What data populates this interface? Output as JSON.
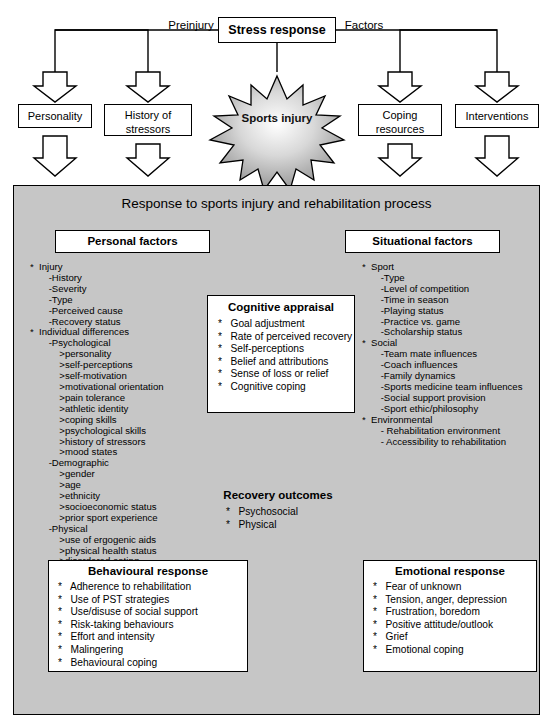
{
  "top": {
    "stress_response": "Stress response",
    "preinjury": "Preinjury",
    "factors": "Factors",
    "personality": "Personality",
    "history_of_stressors": "History of\nstressors",
    "coping_resources": "Coping\nresources",
    "interventions": "Interventions",
    "sports_injury": "Sports injury"
  },
  "panel": {
    "heading": "Response to sports injury and rehabilitation process",
    "personal_factors_title": "Personal factors",
    "situational_factors_title": "Situational factors",
    "personal_factors_list": "*  Injury\n       -History\n       -Severity\n       -Type\n       -Perceived cause\n       -Recovery status\n*  Individual differences\n       -Psychological\n           >personality\n           >self-perceptions\n           >self-motivation\n           >motivational orientation\n           >pain tolerance\n           >athletic identity\n           >coping skills\n           >psychological skills\n           >history of stressors\n           >mood states\n       -Demographic\n           >gender\n           >age\n           >ethnicity\n           >socioeconomic status\n           >prior sport experience\n       -Physical\n           >use of ergogenic aids\n           >physical health status\n           >disordered eating",
    "situational_factors_list": "*  Sport\n       -Type\n       -Level of competition\n       -Time in season\n       -Playing status\n       -Practice vs. game\n       -Scholarship status\n*  Social\n       -Team mate influences\n       -Coach influences\n       -Family dynamics\n       -Sports medicine team influences\n       -Social support provision\n       -Sport ethic/philosophy\n*  Environmental\n       - Rehabilitation environment\n       - Accessibility to rehabilitation"
  },
  "cognitive": {
    "title": "Cognitive appraisal",
    "items": "*   Goal adjustment\n*   Rate of perceived recovery\n*   Self-perceptions\n*   Belief and attributions\n*   Sense of loss or relief\n*   Cognitive coping"
  },
  "behavioural": {
    "title": "Behavioural response",
    "items": "*   Adherence to rehabilitation\n*   Use of PST strategies\n*   Use/disuse of social support\n*   Risk-taking behaviours\n*   Effort and intensity\n*   Malingering\n*   Behavioural coping"
  },
  "emotional": {
    "title": "Emotional response",
    "items": "*   Fear of unknown\n*   Tension, anger, depression\n*   Frustration, boredom\n*   Positive attitude/outlook\n*   Grief\n*   Emotional coping"
  },
  "recovery": {
    "title": "Recovery outcomes",
    "items": "*   Psychosocial\n*   Physical"
  },
  "colors": {
    "panel_bg": "#c6c6c6",
    "arrow_dark": "#5a5a5a",
    "arrow_light": "#9a9a9a",
    "star_fill": "#b4b4b4",
    "outline": "#000000"
  }
}
